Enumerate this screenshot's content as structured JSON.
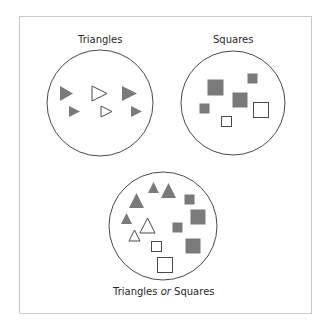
{
  "colors": {
    "fill": "#7a7a7a",
    "stroke": "#4a4a4a",
    "frame": "#c9c9c9",
    "text": "#2a2a2a"
  },
  "sets": [
    {
      "id": "triangles",
      "label": "Triangles",
      "circle": {
        "cx": 100,
        "cy": 103,
        "r": 53
      },
      "label_pos": {
        "x": 100,
        "y": 34
      },
      "shapes": [
        {
          "type": "triangle-right",
          "style": "filled",
          "x": 60,
          "y": 86,
          "w": 13,
          "h": 15
        },
        {
          "type": "triangle-right",
          "style": "outline",
          "x": 92,
          "y": 86,
          "w": 15,
          "h": 15
        },
        {
          "type": "triangle-right",
          "style": "filled",
          "x": 122,
          "y": 86,
          "w": 15,
          "h": 15
        },
        {
          "type": "triangle-right",
          "style": "filled",
          "x": 69,
          "y": 106,
          "w": 11,
          "h": 11
        },
        {
          "type": "triangle-right",
          "style": "outline",
          "x": 101,
          "y": 106,
          "w": 11,
          "h": 11
        },
        {
          "type": "triangle-right",
          "style": "filled",
          "x": 131,
          "y": 106,
          "w": 11,
          "h": 11
        }
      ]
    },
    {
      "id": "squares",
      "label": "Squares",
      "circle": {
        "cx": 233,
        "cy": 103,
        "r": 52
      },
      "label_pos": {
        "x": 233,
        "y": 34
      },
      "shapes": [
        {
          "type": "square",
          "style": "filled",
          "x": 207,
          "y": 79,
          "s": 17
        },
        {
          "type": "square",
          "style": "filled",
          "x": 247,
          "y": 73,
          "s": 11
        },
        {
          "type": "square",
          "style": "filled",
          "x": 232,
          "y": 92,
          "s": 16
        },
        {
          "type": "square",
          "style": "filled",
          "x": 199,
          "y": 103,
          "s": 11
        },
        {
          "type": "square",
          "style": "outline",
          "x": 253,
          "y": 102,
          "s": 16
        },
        {
          "type": "square",
          "style": "outline",
          "x": 221,
          "y": 116,
          "s": 11
        }
      ]
    },
    {
      "id": "union",
      "label_parts": [
        "Triangles ",
        "or",
        " Squares"
      ],
      "circle": {
        "cx": 163,
        "cy": 226,
        "r": 54
      },
      "label_pos": {
        "x": 164,
        "y": 286
      },
      "shapes": [
        {
          "type": "triangle-up",
          "style": "filled",
          "x": 148,
          "y": 182,
          "w": 11,
          "h": 11
        },
        {
          "type": "triangle-up",
          "style": "filled",
          "x": 161,
          "y": 183,
          "w": 15,
          "h": 15
        },
        {
          "type": "triangle-up",
          "style": "filled",
          "x": 129,
          "y": 193,
          "w": 15,
          "h": 15
        },
        {
          "type": "triangle-up",
          "style": "filled",
          "x": 121,
          "y": 213,
          "w": 11,
          "h": 11
        },
        {
          "type": "triangle-up",
          "style": "outline",
          "x": 140,
          "y": 218,
          "w": 15,
          "h": 15
        },
        {
          "type": "triangle-up",
          "style": "outline",
          "x": 129,
          "y": 230,
          "w": 11,
          "h": 11
        },
        {
          "type": "square",
          "style": "filled",
          "x": 184,
          "y": 194,
          "s": 11
        },
        {
          "type": "square",
          "style": "filled",
          "x": 190,
          "y": 209,
          "s": 16
        },
        {
          "type": "square",
          "style": "filled",
          "x": 172,
          "y": 222,
          "s": 11
        },
        {
          "type": "square",
          "style": "filled",
          "x": 185,
          "y": 238,
          "s": 16
        },
        {
          "type": "square",
          "style": "outline",
          "x": 151,
          "y": 241,
          "s": 11
        },
        {
          "type": "square",
          "style": "outline",
          "x": 157,
          "y": 257,
          "s": 16
        }
      ]
    }
  ]
}
